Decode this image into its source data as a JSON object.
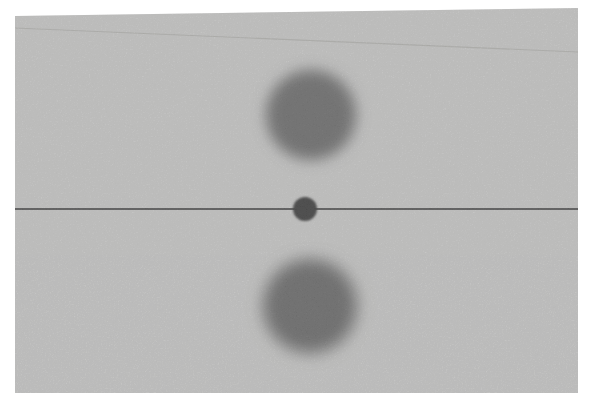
{
  "canvas": {
    "width": 593,
    "height": 415,
    "background": "#ffffff"
  },
  "photo": {
    "background": "#cbcbca",
    "outline_points": "15,16 578,8 578,393 15,393",
    "scratch_line": {
      "x1": 15,
      "y1": 28,
      "x2": 578,
      "y2": 52,
      "color": "#b7b7b4",
      "width": 1.2
    },
    "reference_line": {
      "x1": 15,
      "y1": 209,
      "x2": 578,
      "y2": 209,
      "color": "#3b3b3b",
      "width": 1.7
    },
    "disks": [
      {
        "cx": 311,
        "cy": 115,
        "r": 45,
        "color": "#737373",
        "blur": 7
      },
      {
        "cx": 310,
        "cy": 306,
        "r": 47,
        "color": "#6f6f6f",
        "blur": 8
      }
    ],
    "ball": {
      "cx": 305,
      "cy": 209,
      "r": 12,
      "color": "#464646",
      "blur": 0.9
    }
  }
}
